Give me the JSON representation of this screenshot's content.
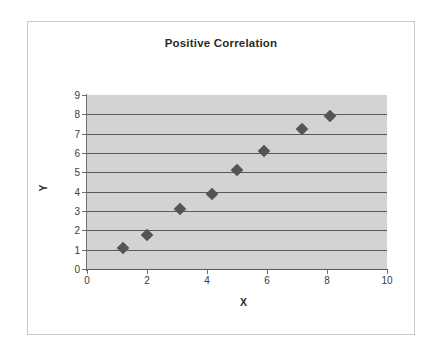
{
  "figure": {
    "border_color": "#c8c8c8",
    "background": "#ffffff"
  },
  "chart_data": {
    "type": "scatter",
    "title": "Positive Correlation",
    "xlabel": "X",
    "ylabel": "Y",
    "xlim": [
      0,
      10
    ],
    "ylim": [
      0,
      9
    ],
    "xticks": [
      0,
      2,
      4,
      6,
      8,
      10
    ],
    "yticks": [
      0,
      1,
      2,
      3,
      4,
      5,
      6,
      7,
      8,
      9
    ],
    "xtick_labels": [
      "0",
      "2",
      "4",
      "6",
      "8",
      "10"
    ],
    "ytick_labels": [
      "0",
      "1",
      "2",
      "3",
      "4",
      "5",
      "6",
      "7",
      "8",
      "9"
    ],
    "grid": "horizontal",
    "gridline_color": "#595959",
    "plot_background": "#d3d3d3",
    "marker": "diamond",
    "marker_color": "#545454",
    "legend": null,
    "series": [
      {
        "name": "Series 1",
        "points": [
          {
            "x": 1.2,
            "y": 1.1
          },
          {
            "x": 2.0,
            "y": 1.75
          },
          {
            "x": 3.1,
            "y": 3.1
          },
          {
            "x": 4.15,
            "y": 3.9
          },
          {
            "x": 5.0,
            "y": 5.1
          },
          {
            "x": 5.9,
            "y": 6.1
          },
          {
            "x": 7.15,
            "y": 7.25
          },
          {
            "x": 8.1,
            "y": 7.9
          }
        ]
      }
    ]
  }
}
